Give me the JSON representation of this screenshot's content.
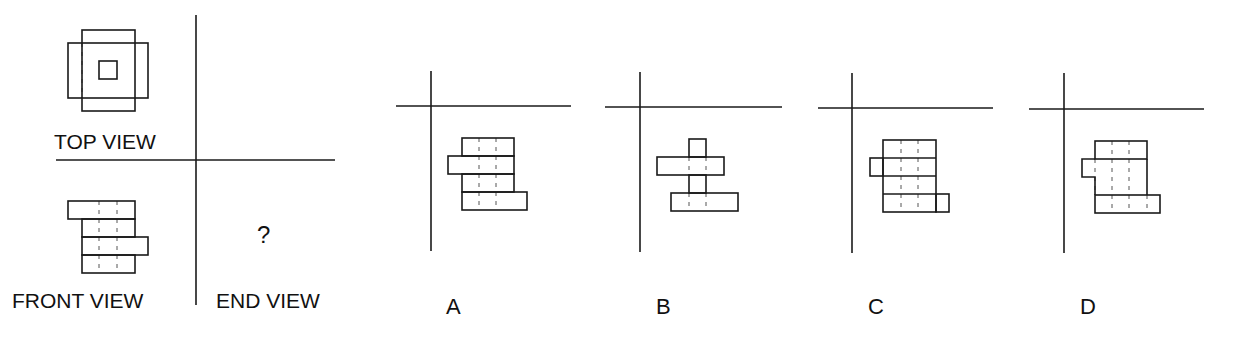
{
  "problem": {
    "labels": {
      "top_view": "TOP VIEW",
      "front_view": "FRONT VIEW",
      "end_view": "END VIEW",
      "unknown": "?"
    },
    "options": [
      {
        "letter": "A"
      },
      {
        "letter": "B"
      },
      {
        "letter": "C"
      },
      {
        "letter": "D"
      }
    ]
  },
  "colors": {
    "stroke": "#1a1a1a",
    "dash": "#555555",
    "background": "#ffffff"
  },
  "geometry": {
    "main_axes": {
      "vertical": [
        196,
        15,
        196,
        305
      ],
      "horizontal": [
        56,
        160,
        335,
        160
      ]
    },
    "top_view": {
      "rects": [
        [
          82,
          30,
          53,
          81
        ],
        [
          68,
          43,
          80,
          55
        ],
        [
          99,
          61,
          18,
          18
        ]
      ],
      "dashes": [
        [
          82,
          43,
          82,
          98
        ]
      ]
    },
    "front_view": {
      "rects": [
        [
          68,
          201,
          67,
          18
        ],
        [
          82,
          219,
          53,
          18
        ],
        [
          82,
          237,
          66,
          18
        ],
        [
          82,
          255,
          53,
          18
        ]
      ],
      "dashes": [
        [
          99,
          201,
          99,
          273
        ],
        [
          117,
          201,
          117,
          273
        ]
      ]
    },
    "option_drawings": [
      {
        "axes": {
          "vertical": [
            431,
            71,
            431,
            251
          ],
          "horizontal": [
            396,
            106,
            571,
            106
          ]
        },
        "rects": [
          [
            462,
            138,
            52,
            18
          ],
          [
            448,
            156,
            66,
            18
          ],
          [
            462,
            174,
            52,
            18
          ],
          [
            462,
            192,
            65,
            18
          ]
        ],
        "paths": [],
        "dashes": [
          [
            479,
            138,
            479,
            210
          ],
          [
            496,
            138,
            496,
            210
          ]
        ]
      },
      {
        "axes": {
          "vertical": [
            640,
            72,
            640,
            252
          ],
          "horizontal": [
            605,
            107,
            782,
            107
          ]
        },
        "rects": [
          [
            689,
            139,
            17,
            18
          ],
          [
            657,
            157,
            67,
            18
          ],
          [
            689,
            175,
            17,
            18
          ],
          [
            671,
            193,
            67,
            18
          ]
        ],
        "paths": [],
        "dashes": [
          [
            689,
            157,
            689,
            175
          ],
          [
            706,
            157,
            706,
            175
          ],
          [
            689,
            193,
            689,
            211
          ],
          [
            706,
            193,
            706,
            211
          ]
        ]
      },
      {
        "axes": {
          "vertical": [
            852,
            73,
            852,
            253
          ],
          "horizontal": [
            818,
            108,
            993,
            108
          ]
        },
        "rects": [
          [
            883,
            140,
            53,
            72
          ],
          [
            870,
            158,
            13,
            18
          ],
          [
            936,
            194,
            13,
            18
          ]
        ],
        "paths": [],
        "lines": [
          [
            883,
            158,
            936,
            158
          ],
          [
            883,
            176,
            936,
            176
          ],
          [
            883,
            194,
            936,
            194
          ]
        ],
        "dashes": [
          [
            901,
            140,
            901,
            212
          ],
          [
            918,
            140,
            918,
            212
          ]
        ]
      },
      {
        "axes": {
          "vertical": [
            1064,
            73,
            1064,
            253
          ],
          "horizontal": [
            1029,
            109,
            1204,
            109
          ]
        },
        "rects": [
          [
            1095,
            141,
            52,
            18
          ],
          [
            1095,
            195,
            65,
            18
          ]
        ],
        "paths": [
          "M1095 159 L1082 159 L1082 177 L1095 177 L1095 195 M1147 159 L1147 195"
        ],
        "dashes": [
          [
            1112,
            141,
            1112,
            213
          ],
          [
            1129,
            141,
            1129,
            213
          ],
          [
            1147,
            195,
            1147,
            213
          ],
          [
            1095,
            159,
            1095,
            195
          ]
        ]
      }
    ]
  },
  "label_positions": {
    "top_view": [
      54,
      131
    ],
    "front_view": [
      12,
      290
    ],
    "end_view": [
      216,
      290
    ],
    "unknown": [
      257,
      223
    ],
    "options": [
      [
        446,
        296
      ],
      [
        656,
        296
      ],
      [
        868,
        296
      ],
      [
        1080,
        296
      ]
    ]
  }
}
